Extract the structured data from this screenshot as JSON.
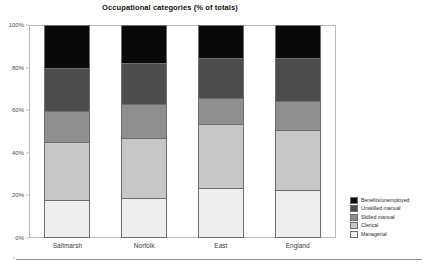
{
  "chart_data": {
    "type": "bar",
    "subtype": "stacked-100-percent",
    "title": "Occupational categories (% of totals)",
    "xlabel": "",
    "ylabel": "",
    "ylim": [
      0,
      100
    ],
    "grid": false,
    "legend_position": "right-bottom",
    "categories": [
      "Saltmarsh",
      "Norfolk",
      "East",
      "England"
    ],
    "y_ticks": [
      "0%",
      "20%",
      "40%",
      "60%",
      "80%",
      "100%"
    ],
    "y_tick_values": [
      0,
      20,
      40,
      60,
      80,
      100
    ],
    "series": [
      {
        "name": "Benefits/unemployed",
        "color": "#0a0a0a",
        "values": [
          20.2,
          17.8,
          15.5,
          15.5
        ]
      },
      {
        "name": "Unskilled manual",
        "color": "#4d4d4d",
        "values": [
          20.2,
          19.2,
          18.8,
          20.2
        ]
      },
      {
        "name": "Skilled manual",
        "color": "#8f8f8f",
        "values": [
          14.6,
          16.0,
          12.2,
          13.6
        ]
      },
      {
        "name": "Clerical",
        "color": "#c7c7c7",
        "values": [
          27.2,
          28.0,
          30.0,
          28.2
        ]
      },
      {
        "name": "Managerial",
        "color": "#eeeeee",
        "values": [
          17.8,
          19.0,
          23.5,
          22.5
        ]
      }
    ]
  },
  "legend": {
    "items": [
      {
        "label": "Benefits/unemployed",
        "color": "#0a0a0a"
      },
      {
        "label": "Unskilled manual",
        "color": "#4d4d4d"
      },
      {
        "label": "Skilled manual",
        "color": "#8f8f8f"
      },
      {
        "label": "Clerical",
        "color": "#c7c7c7"
      },
      {
        "label": "Managerial",
        "color": "#eeeeee"
      }
    ]
  },
  "colors": {
    "background": "#ffffff",
    "frame": "#b9b9b9",
    "segment_border": "#6e6e6e",
    "text": "#1a1a1a",
    "tick_text": "#4a4a4a"
  },
  "footer": {
    "corner_mark": "‹"
  }
}
